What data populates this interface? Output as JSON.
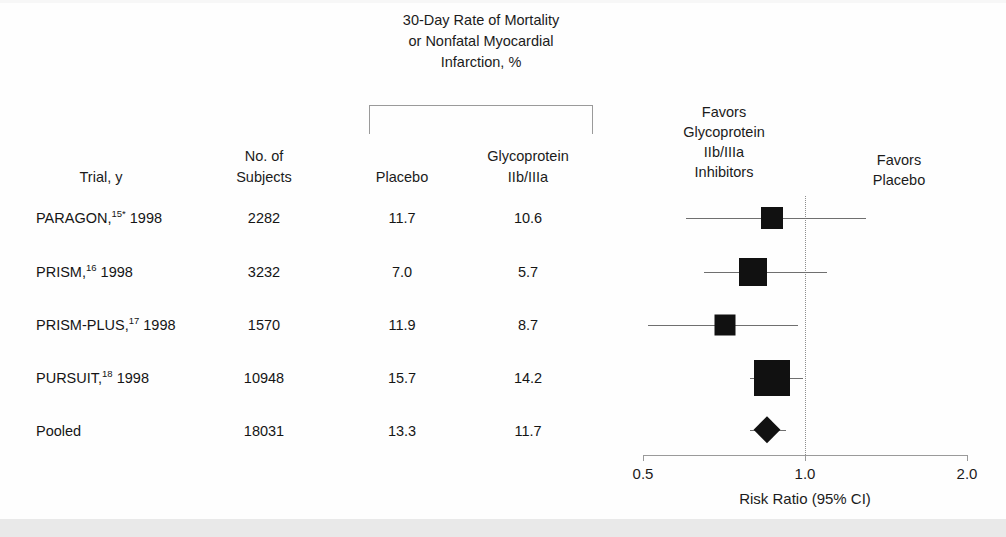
{
  "figure": {
    "pct_header": [
      "30-Day Rate of Mortality",
      "or Nonfatal Myocardial",
      "Infarction, %"
    ],
    "columns": {
      "trial": "Trial, y",
      "subjects_line1": "No. of",
      "subjects_line2": "Subjects",
      "placebo": "Placebo",
      "glyco_line1": "Glycoprotein",
      "glyco_line2": "IIb/IIIa"
    },
    "favors_left": [
      "Favors",
      "Glycoprotein",
      "IIb/IIIa",
      "Inhibitors"
    ],
    "favors_right": [
      "Favors",
      "Placebo"
    ],
    "axis_title": "Risk Ratio (95% CI)",
    "tick_labels": [
      "0.5",
      "1.0",
      "2.0"
    ],
    "marker_color": "#111111",
    "refline_color": "#8d8d8d",
    "band_color": "#e9e9e9"
  },
  "rows": [
    {
      "trial_name": "PARAGON,",
      "trial_ref": "15*",
      "trial_year": "1998",
      "subjects": "2282",
      "placebo": "11.7",
      "glyco": "10.6"
    },
    {
      "trial_name": "PRISM,",
      "trial_ref": "16",
      "trial_year": "1998",
      "subjects": "3232",
      "placebo": "7.0",
      "glyco": "5.7"
    },
    {
      "trial_name": "PRISM-PLUS,",
      "trial_ref": "17",
      "trial_year": "1998",
      "subjects": "1570",
      "placebo": "11.9",
      "glyco": "8.7"
    },
    {
      "trial_name": "PURSUIT,",
      "trial_ref": "18",
      "trial_year": "1998",
      "subjects": "10948",
      "placebo": "15.7",
      "glyco": "14.2"
    },
    {
      "trial_name": "Pooled",
      "trial_ref": "",
      "trial_year": "",
      "subjects": "18031",
      "placebo": "13.3",
      "glyco": "11.7"
    }
  ],
  "chart_data": {
    "type": "forest",
    "title": "30-Day Rate of Mortality or Nonfatal Myocardial Infarction, %",
    "xlabel": "Risk Ratio (95% CI)",
    "ylabel": "",
    "xscale": "log",
    "xlim": [
      0.5,
      2.0
    ],
    "xticks": [
      0.5,
      1.0,
      2.0
    ],
    "xticklabels": [
      "0.5",
      "1.0",
      "2.0"
    ],
    "reference_line": 1.0,
    "grid": false,
    "legend": "none",
    "left_annotation": "Favors Glycoprotein IIb/IIIa Inhibitors",
    "right_annotation": "Favors Placebo",
    "studies": [
      {
        "label": "PARAGON, 1998",
        "n": 2282,
        "placebo_pct": 11.7,
        "treatment_pct": 10.6,
        "risk_ratio": 0.87,
        "ci_low": 0.6,
        "ci_high": 1.3,
        "marker": "square",
        "marker_size": 22
      },
      {
        "label": "PRISM, 1998",
        "n": 3232,
        "placebo_pct": 7.0,
        "treatment_pct": 5.7,
        "risk_ratio": 0.8,
        "ci_low": 0.65,
        "ci_high": 1.1,
        "marker": "square",
        "marker_size": 28
      },
      {
        "label": "PRISM-PLUS, 1998",
        "n": 1570,
        "placebo_pct": 11.9,
        "treatment_pct": 8.7,
        "risk_ratio": 0.71,
        "ci_low": 0.51,
        "ci_high": 0.97,
        "marker": "square",
        "marker_size": 21
      },
      {
        "label": "PURSUIT, 1998",
        "n": 10948,
        "placebo_pct": 15.7,
        "treatment_pct": 14.2,
        "risk_ratio": 0.87,
        "ci_low": 0.79,
        "ci_high": 0.99,
        "marker": "square",
        "marker_size": 36
      },
      {
        "label": "Pooled",
        "n": 18031,
        "placebo_pct": 13.3,
        "treatment_pct": 11.7,
        "risk_ratio": 0.85,
        "ci_low": 0.79,
        "ci_high": 0.92,
        "marker": "diamond",
        "marker_size": 27
      }
    ]
  },
  "geometry": {
    "plot_x0": 643,
    "plot_x1": 967,
    "axis_y": 455,
    "row_y": [
      218,
      272,
      325,
      378,
      430
    ],
    "col_x": {
      "trial": 36,
      "subjects": 264,
      "placebo": 402,
      "glyco": 528
    },
    "bracket": {
      "left": 369,
      "top": 105,
      "width": 224,
      "height": 29
    },
    "band_top": 519
  }
}
